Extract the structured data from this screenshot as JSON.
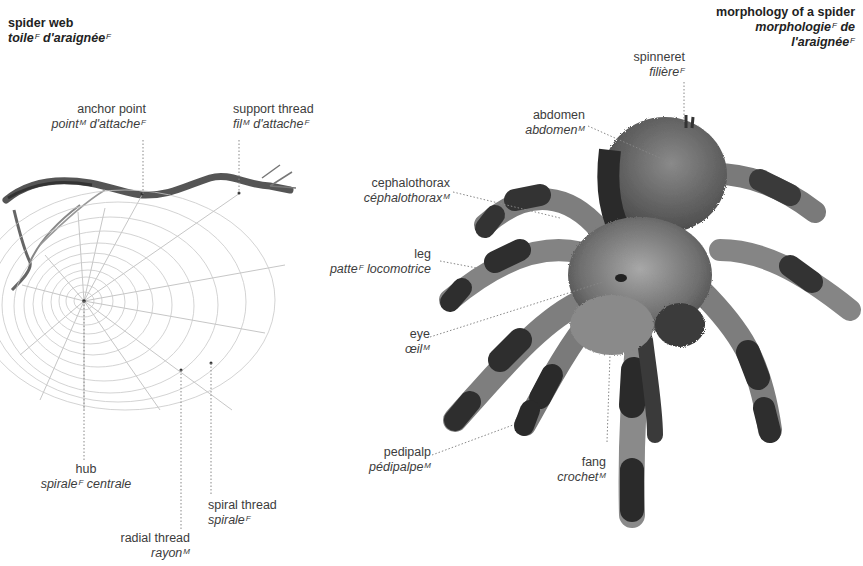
{
  "web_section": {
    "title": {
      "en": "spider web",
      "fr_parts": [
        {
          "t": "toile",
          "g": "F"
        },
        {
          "t": " d'araignée",
          "g": "F"
        }
      ]
    },
    "labels": {
      "anchor_point": {
        "en": "anchor point",
        "fr1": "point",
        "g1": "M",
        "fr2": " d'attache",
        "g2": "F"
      },
      "support_thread": {
        "en": "support thread",
        "fr1": "fil",
        "g1": "M",
        "fr2": " d'attache",
        "g2": "F"
      },
      "hub": {
        "en": "hub",
        "fr1": "spirale",
        "g1": "F",
        "fr2": " centrale"
      },
      "radial_thread": {
        "en": "radial thread",
        "fr1": "rayon",
        "g1": "M"
      },
      "spiral_thread": {
        "en": "spiral thread",
        "fr1": "spirale",
        "g1": "F"
      }
    }
  },
  "spider_section": {
    "title": {
      "en": "morphology of a spider",
      "fr1": "morphologie",
      "g1": "F",
      "fr1b": " de",
      "fr2": "l'araignée",
      "g2": "F"
    },
    "labels": {
      "spinneret": {
        "en": "spinneret",
        "fr1": "filière",
        "g1": "F"
      },
      "abdomen": {
        "en": "abdomen",
        "fr1": "abdomen",
        "g1": "M"
      },
      "cephalothorax": {
        "en": "cephalothorax",
        "fr1": "céphalothorax",
        "g1": "M"
      },
      "leg": {
        "en": "leg",
        "fr1": "patte",
        "g1": "F",
        "fr2": " locomotrice"
      },
      "eye": {
        "en": "eye",
        "fr1": "œil",
        "g1": "M"
      },
      "pedipalp": {
        "en": "pedipalp",
        "fr1": "pédipalpe",
        "g1": "M"
      },
      "fang": {
        "en": "fang",
        "fr1": "crochet",
        "g1": "M"
      }
    }
  },
  "colors": {
    "text": "#3c3c3c",
    "leader": "#888888",
    "web": "#b8b8b8",
    "spider_dark": "#2a2a2a",
    "spider_light": "#9a9a9a"
  }
}
